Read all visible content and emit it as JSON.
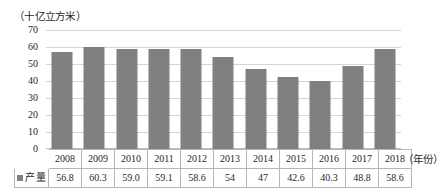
{
  "chart_data": {
    "type": "bar",
    "title": "",
    "unit_caption": "（十亿立方米）",
    "xlabel": "（年份）",
    "ylabel": "",
    "categories": [
      "2008",
      "2009",
      "2010",
      "2011",
      "2012",
      "2013",
      "2014",
      "2015",
      "2016",
      "2017",
      "2018"
    ],
    "values": [
      56.8,
      60.3,
      59.0,
      59.1,
      58.6,
      54,
      47,
      42.6,
      40.3,
      48.8,
      58.6
    ],
    "value_labels": [
      "56.8",
      "60.3",
      "59.0",
      "59.1",
      "58.6",
      "54",
      "47",
      "42.6",
      "40.3",
      "48.8",
      "58.6"
    ],
    "series": [
      {
        "name": "产量",
        "values": [
          56.8,
          60.3,
          59.0,
          59.1,
          58.6,
          54,
          47,
          42.6,
          40.3,
          48.8,
          58.6
        ],
        "color": "#808080"
      }
    ],
    "ylim": [
      0,
      70
    ],
    "yticks": [
      0,
      10,
      20,
      30,
      40,
      50,
      60,
      70
    ],
    "ytick_labels": [
      "0",
      "10",
      "20",
      "30",
      "40",
      "50",
      "60",
      "70"
    ],
    "grid": true,
    "grid_color": "#d6d6d6",
    "legend": {
      "position": "table-row-header",
      "entries": [
        {
          "label": "产量",
          "color": "#808080"
        }
      ]
    },
    "data_table": {
      "row_label": "产量",
      "corner_label": "",
      "headers": [
        "2008",
        "2009",
        "2010",
        "2011",
        "2012",
        "2013",
        "2014",
        "2015",
        "2016",
        "2017",
        "2018"
      ],
      "cells": [
        "56.8",
        "60.3",
        "59.0",
        "59.1",
        "58.6",
        "54",
        "47",
        "42.6",
        "40.3",
        "48.8",
        "58.6"
      ]
    }
  }
}
